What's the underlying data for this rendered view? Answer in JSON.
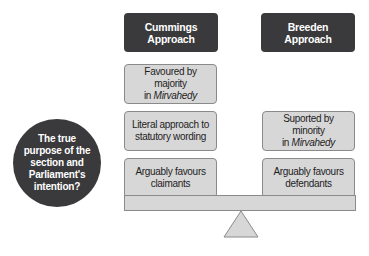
{
  "headers": {
    "left": [
      "Cummings",
      "Approach"
    ],
    "right": [
      "Breeden",
      "Approach"
    ]
  },
  "left_boxes": [
    {
      "line1": "Favoured by majority",
      "line2_pre": "in ",
      "line2_em": "Mirvahedy"
    },
    {
      "line1": "Literal approach to",
      "line2_pre": "statutory wording",
      "line2_em": ""
    },
    {
      "line1": "Arguably favours",
      "line2_pre": "claimants",
      "line2_em": ""
    }
  ],
  "right_boxes": [
    {
      "line1": "Suported by minority",
      "line2_pre": "in ",
      "line2_em": "Mirvahedy"
    },
    {
      "line1": "Arguably favours",
      "line2_pre": "defendants",
      "line2_em": ""
    }
  ],
  "circle": [
    "The true",
    "purpose of the",
    "section and",
    "Parliament's",
    "intention?"
  ],
  "colors": {
    "dark": "#3a3a3c",
    "box_fill": "#d7d7d7",
    "box_border": "#8a8a8a"
  }
}
